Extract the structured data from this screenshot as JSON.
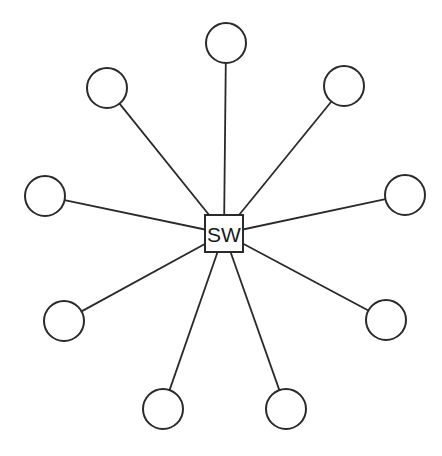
{
  "diagram": {
    "type": "star-topology",
    "hub": {
      "label": "SW",
      "x": 205,
      "y": 215,
      "width": 38,
      "height": 37
    },
    "nodes": [
      {
        "id": "top",
        "cx": 226,
        "cy": 43
      },
      {
        "id": "top-right",
        "cx": 344,
        "cy": 86
      },
      {
        "id": "right",
        "cx": 405,
        "cy": 195
      },
      {
        "id": "lower-right",
        "cx": 386,
        "cy": 320
      },
      {
        "id": "bottom-right",
        "cx": 286,
        "cy": 409
      },
      {
        "id": "bottom-left",
        "cx": 163,
        "cy": 409
      },
      {
        "id": "lower-left",
        "cx": 64,
        "cy": 321
      },
      {
        "id": "left",
        "cx": 45,
        "cy": 196
      },
      {
        "id": "top-left",
        "cx": 107,
        "cy": 88
      }
    ],
    "node_radius": 20,
    "stroke_color": "#2a2a2a"
  }
}
